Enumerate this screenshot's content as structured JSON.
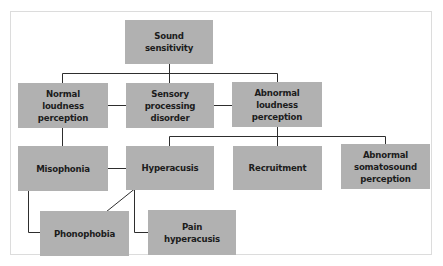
{
  "diagram": {
    "colors": {
      "node_fill": "#b1b1b1",
      "text": "#1c1c1c",
      "line": "#2e2e2e",
      "frame_border": "#dcdcdc"
    },
    "nodes": {
      "sound_sensitivity": "Sound\nsensitivity",
      "normal_loudness": "Normal\nloudness\nperception",
      "sensory_processing": "Sensory\nprocessing\ndisorder",
      "abnormal_loudness": "Abnormal\nloudness\nperception",
      "misophonia": "Misophonia",
      "hyperacusis": "Hyperacusis",
      "recruitment": "Recruitment",
      "abnormal_somatosound": "Abnormal\nsomatosound\nperception",
      "phonophobia": "Phonophobia",
      "pain_hyperacusis": "Pain\nhyperacusis"
    },
    "edges": [
      {
        "from": "Sound sensitivity",
        "to": "Normal loudness perception",
        "type": "tree"
      },
      {
        "from": "Sound sensitivity",
        "to": "Sensory processing disorder",
        "type": "tree"
      },
      {
        "from": "Sound sensitivity",
        "to": "Abnormal loudness perception",
        "type": "tree"
      },
      {
        "from": "Normal loudness perception",
        "to": "Sensory processing disorder",
        "type": "bidirectional"
      },
      {
        "from": "Sensory processing disorder",
        "to": "Abnormal loudness perception",
        "type": "bidirectional"
      },
      {
        "from": "Normal loudness perception",
        "to": "Misophonia",
        "type": "tree"
      },
      {
        "from": "Abnormal loudness perception",
        "to": "Hyperacusis",
        "type": "tree"
      },
      {
        "from": "Abnormal loudness perception",
        "to": "Recruitment",
        "type": "tree"
      },
      {
        "from": "Abnormal loudness perception",
        "to": "Abnormal somatosound perception",
        "type": "tree"
      },
      {
        "from": "Misophonia",
        "to": "Hyperacusis",
        "type": "bidirectional"
      },
      {
        "from": "Misophonia",
        "to": "Phonophobia",
        "type": "tree"
      },
      {
        "from": "Hyperacusis",
        "to": "Phonophobia",
        "type": "bidirectional"
      },
      {
        "from": "Hyperacusis",
        "to": "Pain hyperacusis",
        "type": "tree"
      }
    ]
  }
}
